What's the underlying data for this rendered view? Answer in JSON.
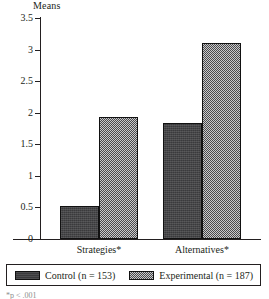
{
  "chart_data": {
    "type": "bar",
    "title": "",
    "ylabel": "Means",
    "xlabel": "",
    "categories": [
      "Strategies*",
      "Alternatives*"
    ],
    "series": [
      {
        "name": "Control (n = 153)",
        "values": [
          0.52,
          1.84
        ],
        "color": "#3a3a3c",
        "pattern": "solid-dark"
      },
      {
        "name": "Experimental (n = 187)",
        "values": [
          1.94,
          3.11
        ],
        "color": "#6e6e70",
        "pattern": "checker-dither"
      }
    ],
    "ylim": [
      0,
      3.5
    ],
    "ytick_labels": [
      "0",
      "0.5",
      "1",
      "1.5",
      "2",
      "2.5",
      "3",
      "3.5"
    ],
    "ytick_values": [
      0,
      0.5,
      1,
      1.5,
      2,
      2.5,
      3,
      3.5
    ],
    "grid": false,
    "legend_position": "bottom"
  },
  "axis": {
    "means_label": "Means"
  },
  "legend": {
    "items": [
      {
        "label": "Control (n = 153)"
      },
      {
        "label": "Experimental (n = 187)"
      }
    ]
  },
  "footnote": {
    "text": "*p < .001"
  }
}
